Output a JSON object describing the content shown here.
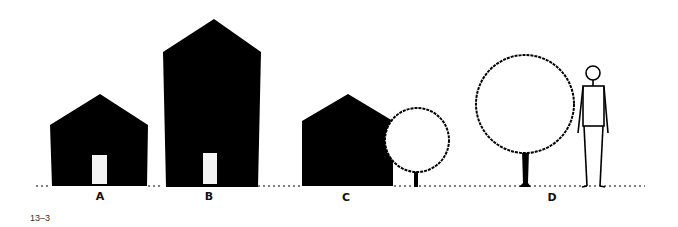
{
  "figure": {
    "number": "13–3",
    "labels": {
      "a": "A",
      "b": "B",
      "c": "C",
      "d": "D"
    },
    "colors": {
      "ink": "#000000",
      "door": "#f4f4f4",
      "background": "#ffffff"
    },
    "elements": [
      {
        "id": "A",
        "type": "house",
        "description": "small house with door"
      },
      {
        "id": "B",
        "type": "house",
        "description": "tall house with door"
      },
      {
        "id": "C",
        "type": "house-with-tree",
        "description": "house beside small round tree"
      },
      {
        "id": "D",
        "type": "tree-with-person",
        "description": "large round tree beside standing person"
      }
    ]
  }
}
